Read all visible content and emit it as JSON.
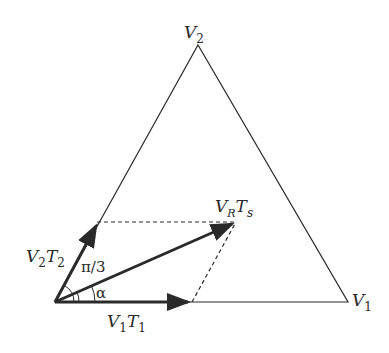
{
  "diagram": {
    "type": "space-vector-triangle",
    "colors": {
      "stroke": "#2a2a2a",
      "background": "#ffffff"
    },
    "vertices": {
      "v2": {
        "label_main": "V",
        "label_sub": "2"
      },
      "v1": {
        "label_main": "V",
        "label_sub": "1"
      }
    },
    "vectors": {
      "v2t2": {
        "l1": "V",
        "s1": "2",
        "l2": "T",
        "s2": "2"
      },
      "v1t1": {
        "l1": "V",
        "s1": "1",
        "l2": "T",
        "s2": "1"
      },
      "vrts": {
        "l1": "V",
        "s1": "R",
        "l2": "T",
        "s2": "s"
      }
    },
    "angles": {
      "pi3": "π/3",
      "alpha": "α"
    }
  }
}
